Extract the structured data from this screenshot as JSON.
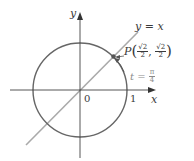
{
  "diagram": {
    "type": "unit-circle",
    "axes": {
      "x_label": "x",
      "y_label": "y",
      "origin_label": "0",
      "tick_label_x": "1"
    },
    "line": {
      "label_lhs": "y",
      "label_eq": "=",
      "label_rhs": "x"
    },
    "point": {
      "name": "P",
      "x_num": "√2",
      "x_den": "2",
      "y_num": "√2",
      "y_den": "2"
    },
    "parameter": {
      "var": "t",
      "eq": "=",
      "num": "π",
      "den": "4"
    },
    "colors": {
      "axes": "#444444",
      "circle": "#666666",
      "line": "#aaaaaa",
      "point": "#555555",
      "text": "#3a3a3a",
      "param_text": "#8a8a8a"
    }
  }
}
